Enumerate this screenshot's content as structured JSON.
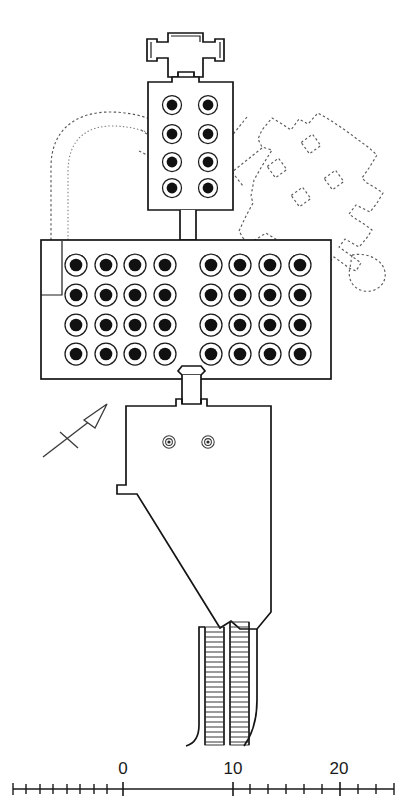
{
  "figure": {
    "kind": "archaeological-site-plan",
    "title": "",
    "orientation_marker": "north-arrow"
  },
  "scale_bar": {
    "labels": [
      {
        "text": "0",
        "value": 0,
        "x": 123,
        "y": 774
      },
      {
        "text": "10",
        "value": 10,
        "x": 233,
        "y": 774
      },
      {
        "text": "20",
        "value": 20,
        "x": 339,
        "y": 774
      }
    ],
    "axis": {
      "x1": 13,
      "x2": 394,
      "y": 789
    },
    "units_per_label": 10,
    "minor_ticks": [
      13,
      26,
      40,
      53,
      67,
      80,
      94,
      107,
      123,
      233,
      250,
      268,
      286,
      304,
      322,
      340,
      358,
      376,
      394
    ],
    "major_ticks": [
      123,
      233,
      340
    ]
  },
  "structures": {
    "north_pavilion": {
      "name": "cruciform-pavilion",
      "label": "",
      "columns": 0
    },
    "upper_hall": {
      "name": "upper-columned-chamber",
      "column_rows": 4,
      "columns_per_row": 2,
      "column_count": 8
    },
    "great_hall": {
      "name": "great-hypostyle-hall",
      "column_rows": 4,
      "columns_per_row": 8,
      "column_count": 32,
      "aisle": "central"
    },
    "lower_hall": {
      "name": "lower-irregular-chamber",
      "column_count": 2
    },
    "stairway": {
      "name": "double-stairway",
      "flights": 2,
      "treads_per_flight": 24
    },
    "ghost_overlay_right": {
      "name": "superimposed-rotated-plan",
      "style": "dashed",
      "pier_count": 4
    },
    "ghost_overlay_left": {
      "name": "superimposed-apse-arcs",
      "style": "dashed",
      "arc_count": 2
    }
  },
  "colors": {
    "wall": "#151515",
    "column_core": "#111111",
    "ghost": "#5a5a5a",
    "background": "#ffffff"
  }
}
